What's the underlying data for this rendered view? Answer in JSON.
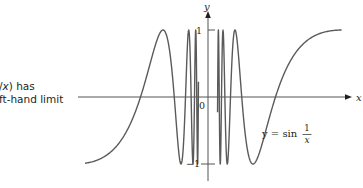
{
  "caption": {
    "line1_prefix": "/",
    "line1_var": "x",
    "line1_suffix": ") has",
    "line2": "ft-hand limit"
  },
  "figure": {
    "x_axis_label": "x",
    "y_axis_label": "y",
    "origin_label": "0",
    "tick_pos_label": "1",
    "tick_neg_label": "−1",
    "equation_lhs": "y = sin",
    "equation_num": "1",
    "equation_den": "x"
  },
  "chart_data": {
    "type": "line",
    "title": "",
    "function": "y = sin(1/x)",
    "xlabel": "x",
    "ylabel": "y",
    "xlim": [
      -0.58,
      0.63
    ],
    "ylim": [
      -1,
      1
    ],
    "yticks": [
      -1,
      1
    ],
    "xticks": [
      0
    ],
    "grid": false,
    "legend": null,
    "annotations": [
      "y = sin 1/x"
    ],
    "series": [
      {
        "name": "y = sin(1/x)",
        "x": [
          -0.58,
          -0.4,
          -0.318,
          -0.212,
          -0.159,
          -0.127,
          -0.091,
          -0.071,
          0.071,
          0.091,
          0.127,
          0.159,
          0.212,
          0.318,
          0.4,
          0.63
        ],
        "values": [
          -0.99,
          -0.6,
          0,
          1,
          0,
          -1,
          0,
          1,
          -1,
          0,
          1,
          0,
          -1,
          0,
          0.6,
          1
        ]
      }
    ]
  },
  "colors": {
    "ink": "#231f20",
    "curve": "#5a5a5a",
    "background": "#ffffff"
  }
}
